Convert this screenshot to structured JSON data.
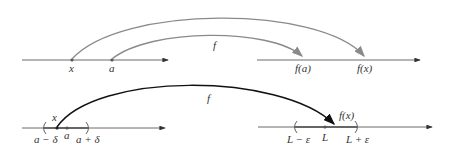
{
  "colors": {
    "axis": "#555555",
    "top_arrows": "#8a8a8a",
    "bottom_arrow": "#111111",
    "interval": "#666666",
    "text": "#333333"
  },
  "top": {
    "function_label": "f",
    "domain_points": [
      {
        "label": "x"
      },
      {
        "label": "a"
      }
    ],
    "range_points": [
      {
        "label": "f(a)"
      },
      {
        "label": "f(x)"
      }
    ]
  },
  "bottom": {
    "function_label": "f",
    "domain": {
      "point_x": "x",
      "center": "a",
      "left_bound": "a − δ",
      "right_bound": "a + δ"
    },
    "range": {
      "image": "f(x)",
      "center": "L",
      "left_bound": "L − ε",
      "right_bound": "L + ε"
    }
  }
}
